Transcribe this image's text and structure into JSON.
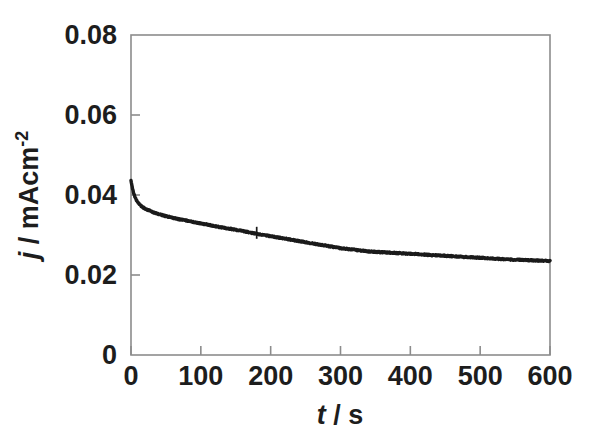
{
  "figure": {
    "background_color": "#ffffff",
    "frame_color": "#8c8c8c",
    "curve_color": "#1a1a1a"
  },
  "axes": {
    "x": {
      "label_plain": "t / s",
      "label_italic_part": "t",
      "label_rest": " / s",
      "ticks": [
        "0",
        "100",
        "200",
        "300",
        "400",
        "500",
        "600"
      ],
      "tick_values": [
        0,
        100,
        200,
        300,
        400,
        500,
        600
      ],
      "range": [
        0,
        600
      ]
    },
    "y": {
      "label_italic_part": "j",
      "label_mid": " / mAcm",
      "label_sup": "-2",
      "label_plain": "j / mAcm-2",
      "ticks": [
        "0",
        "0.02",
        "0.04",
        "0.06",
        "0.08"
      ],
      "tick_values": [
        0,
        0.02,
        0.04,
        0.06,
        0.08
      ],
      "range": [
        0,
        0.08
      ]
    }
  },
  "chart_data": {
    "type": "line",
    "title": "",
    "xlabel": "t / s",
    "ylabel": "j / mAcm-2",
    "xlim": [
      0,
      600
    ],
    "ylim": [
      0,
      0.08
    ],
    "grid": false,
    "legend": null,
    "series": [
      {
        "name": "chronoamperometric current density",
        "color": "#1a1a1a",
        "x": [
          0,
          2,
          4,
          6,
          8,
          10,
          12,
          15,
          18,
          21,
          25,
          30,
          35,
          40,
          45,
          50,
          60,
          70,
          80,
          90,
          100,
          110,
          120,
          130,
          140,
          150,
          160,
          170,
          180,
          190,
          200,
          210,
          220,
          230,
          240,
          250,
          260,
          270,
          280,
          290,
          300,
          310,
          320,
          330,
          340,
          350,
          360,
          370,
          380,
          390,
          400,
          410,
          420,
          430,
          440,
          450,
          460,
          470,
          480,
          490,
          500,
          510,
          520,
          530,
          540,
          550,
          560,
          570,
          580,
          590,
          600
        ],
        "y": [
          0.0437,
          0.0418,
          0.0403,
          0.0393,
          0.0386,
          0.0381,
          0.0377,
          0.0372,
          0.0368,
          0.0365,
          0.0362,
          0.0358,
          0.0355,
          0.0352,
          0.035,
          0.0347,
          0.0343,
          0.0339,
          0.0336,
          0.0332,
          0.0329,
          0.0326,
          0.0322,
          0.0319,
          0.0316,
          0.0313,
          0.031,
          0.0306,
          0.0303,
          0.03,
          0.0297,
          0.0294,
          0.0291,
          0.0288,
          0.0285,
          0.0282,
          0.0279,
          0.0276,
          0.0273,
          0.027,
          0.0267,
          0.0265,
          0.0263,
          0.0261,
          0.0259,
          0.0258,
          0.0257,
          0.0256,
          0.0255,
          0.0254,
          0.0253,
          0.0252,
          0.0251,
          0.025,
          0.0249,
          0.0248,
          0.0247,
          0.0246,
          0.0245,
          0.0244,
          0.0243,
          0.0242,
          0.0241,
          0.024,
          0.0239,
          0.0238,
          0.0238,
          0.0237,
          0.0236,
          0.0236,
          0.0235
        ]
      }
    ],
    "annotations": [
      {
        "name": "noise-spike",
        "x": 180,
        "note": "small vertical noise spike in trace"
      }
    ]
  }
}
